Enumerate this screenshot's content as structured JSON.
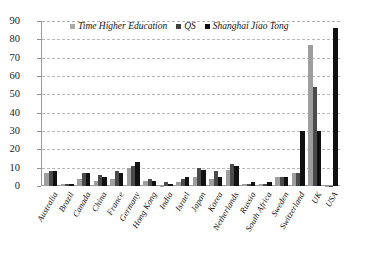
{
  "chart_data": {
    "type": "bar",
    "title": "",
    "subtitle": "",
    "xlabel": "",
    "ylabel": "",
    "ylim": [
      0,
      90
    ],
    "yticks": [
      0,
      10,
      20,
      30,
      40,
      50,
      60,
      70,
      80,
      90
    ],
    "grid": true,
    "legend_position": "top-center",
    "orientation": "vertical-grouped",
    "categories": [
      "Australia",
      "Brazil",
      "Canada",
      "China",
      "France",
      "Germany",
      "Hong Kong",
      "India",
      "Israel",
      "Japan",
      "Korea",
      "Netherlands",
      "Russia",
      "South Africa",
      "Sweden",
      "Switzerland",
      "UK",
      "USA"
    ],
    "series": [
      {
        "name": "Time Higher Education",
        "color": "#9e9e9e",
        "values": [
          7,
          1,
          4,
          3,
          4,
          10,
          3,
          0,
          2,
          5,
          4,
          9,
          1,
          1,
          5,
          7,
          77,
          0
        ]
      },
      {
        "name": "QS",
        "color": "#4a4a4a",
        "values": [
          8,
          1,
          7,
          6,
          8,
          11,
          4,
          2,
          4,
          10,
          8,
          12,
          1,
          1,
          5,
          7,
          54,
          0
        ]
      },
      {
        "name": "Shanghai Jiao Tong",
        "color": "#111111",
        "values": [
          8,
          1,
          7,
          5,
          7,
          13,
          3,
          1,
          5,
          9,
          5,
          11,
          2,
          2,
          5,
          30,
          30,
          86
        ]
      }
    ]
  },
  "legend": {
    "items": [
      {
        "label": "Time Higher Education"
      },
      {
        "label": "QS"
      },
      {
        "label": "Shanghai Jiao Tong"
      }
    ]
  },
  "axis": {
    "y_tick_labels": [
      "90",
      "80",
      "70",
      "60",
      "50",
      "40",
      "30",
      "20",
      "10",
      "0"
    ]
  }
}
